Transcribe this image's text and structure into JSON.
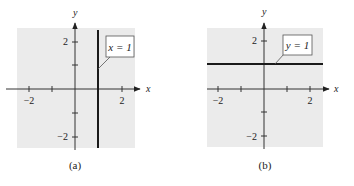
{
  "panels": [
    {
      "id": "a",
      "caption": "(a)",
      "x_axis_label": "x",
      "y_axis_label": "y",
      "x_tick_labels": [
        "−2",
        "2"
      ],
      "y_tick_labels": [
        "2",
        "−2"
      ],
      "line_label": "x = 1",
      "line_type": "vertical",
      "line_value": 1
    },
    {
      "id": "b",
      "caption": "(b)",
      "x_axis_label": "x",
      "y_axis_label": "y",
      "x_tick_labels": [
        "−2",
        "2"
      ],
      "y_tick_labels": [
        "2",
        "−2"
      ],
      "line_label": "y = 1",
      "line_type": "horizontal",
      "line_value": 1
    }
  ],
  "colors": {
    "background": "#ebebeb",
    "axis": "#333333",
    "line": "#1a1a1a",
    "label_box_border": "#555555"
  }
}
